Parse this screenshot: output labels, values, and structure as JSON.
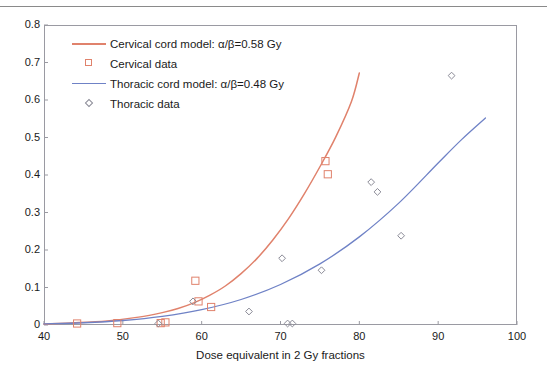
{
  "figure": {
    "top_rule": "horizontal-rule"
  },
  "chart_data": {
    "type": "scatter",
    "title": "",
    "xlabel": "Dose equivalent in 2 Gy fractions",
    "ylabel": "",
    "xlim": [
      40,
      100
    ],
    "ylim": [
      0,
      0.8
    ],
    "xticks": [
      40,
      50,
      60,
      70,
      80,
      90,
      100
    ],
    "yticks": [
      "0",
      "0.1",
      "0.2",
      "0.3",
      "0.4",
      "0.5",
      "0.6",
      "0.7",
      "0.8"
    ],
    "grid": false,
    "legend_position": "upper-left-inside",
    "colors": {
      "cervical": "#e0826c",
      "thoracic": "#6f82c6",
      "axis": "#9a9aa2",
      "text": "#1a1a1a"
    },
    "series": [
      {
        "name": "Cervical cord model: α/β=0.58 Gy",
        "type": "line",
        "color": "#e0826c",
        "x": [
          40,
          44,
          48,
          52,
          55,
          57,
          59,
          61,
          63,
          65,
          67,
          69,
          71,
          73,
          75,
          77,
          79,
          80
        ],
        "values": [
          0.003,
          0.006,
          0.011,
          0.021,
          0.033,
          0.044,
          0.059,
          0.079,
          0.104,
          0.137,
          0.177,
          0.226,
          0.283,
          0.349,
          0.422,
          0.501,
          0.596,
          0.672
        ]
      },
      {
        "name": "Cervical data",
        "type": "scatter",
        "marker": "square",
        "color": "#e0826c",
        "x": [
          44.2,
          49.3,
          54.8,
          55.4,
          59.2,
          59.6,
          61.2,
          75.7,
          76.0
        ],
        "values": [
          0.004,
          0.005,
          0.005,
          0.007,
          0.118,
          0.063,
          0.048,
          0.437,
          0.402
        ]
      },
      {
        "name": "Thoracic cord model: α/β=0.48 Gy",
        "type": "line",
        "color": "#6f82c6",
        "x": [
          40,
          45,
          50,
          55,
          60,
          65,
          70,
          75,
          80,
          85,
          90,
          93,
          96
        ],
        "values": [
          0.003,
          0.006,
          0.012,
          0.023,
          0.041,
          0.068,
          0.108,
          0.163,
          0.235,
          0.325,
          0.432,
          0.495,
          0.552
        ]
      },
      {
        "name": "Thoracic data",
        "type": "scatter",
        "marker": "diamond",
        "color": "#8a8a96",
        "x": [
          54.5,
          58.9,
          66.0,
          70.9,
          70.2,
          71.5,
          75.2,
          81.5,
          82.3,
          85.3,
          91.7
        ],
        "values": [
          0.004,
          0.063,
          0.036,
          0.004,
          0.178,
          0.004,
          0.146,
          0.381,
          0.355,
          0.238,
          0.665
        ]
      }
    ],
    "legend_entries": [
      {
        "label": "Cervical cord model: α/β=0.58 Gy",
        "key": "line",
        "color": "#e0826c"
      },
      {
        "label": "Cervical data",
        "key": "square",
        "color": "#e0826c"
      },
      {
        "label": "Thoracic cord model: α/β=0.48 Gy",
        "key": "line",
        "color": "#6f82c6"
      },
      {
        "label": "Thoracic data",
        "key": "diamond",
        "color": "#8a8a96"
      }
    ]
  }
}
